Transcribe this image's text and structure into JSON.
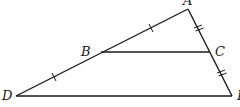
{
  "diagram": {
    "type": "geometry-triangle-midsegment",
    "points": {
      "A": {
        "label": "A",
        "x": 188,
        "y": 9
      },
      "B": {
        "label": "B",
        "x": 101,
        "y": 52
      },
      "C": {
        "label": "C",
        "x": 210,
        "y": 52
      },
      "D": {
        "label": "D",
        "x": 16,
        "y": 96
      },
      "E": {
        "label": "E",
        "x": 232,
        "y": 96
      }
    },
    "segments": [
      {
        "from": "A",
        "to": "D"
      },
      {
        "from": "A",
        "to": "E"
      },
      {
        "from": "D",
        "to": "E"
      },
      {
        "from": "B",
        "to": "C"
      }
    ],
    "congruence_marks": [
      {
        "segment": "AB",
        "ticks": 1
      },
      {
        "segment": "BD",
        "ticks": 1
      },
      {
        "segment": "AC",
        "ticks": 2
      },
      {
        "segment": "CE",
        "ticks": 2
      }
    ],
    "labels": {
      "A": "A",
      "B": "B",
      "C": "C",
      "D": "D",
      "E": "E"
    },
    "stroke_color": "#1a1a1a"
  }
}
